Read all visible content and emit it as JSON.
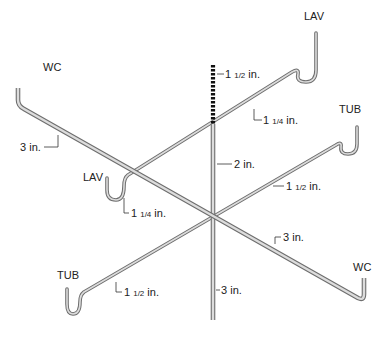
{
  "diagram": {
    "fixtures": {
      "lav_top": "LAV",
      "tub_right": "TUB",
      "wc_left": "WC",
      "lav_left": "LAV",
      "wc_right": "WC",
      "tub_left": "TUB"
    },
    "dimensions": {
      "vent_stack": "1 1/2 in.",
      "lav_top_branch": "1 1/4 in.",
      "stack_upper": "2 in.",
      "wc_left_branch": "3 in.",
      "lav_left_branch": "1 1/4 in.",
      "tub_right_branch": "1 1/2 in.",
      "wc_right_branch": "3 in.",
      "tub_left_branch": "1 1/2 in.",
      "stack_lower": "3 in."
    },
    "dim_parts": {
      "vent_stack": {
        "whole": "1 ",
        "frac": "1/2",
        "unit": " in."
      },
      "lav_top_branch": {
        "whole": "1 ",
        "frac": "1/4",
        "unit": " in."
      },
      "stack_upper": {
        "whole": "2",
        "frac": "",
        "unit": " in."
      },
      "wc_left_branch": {
        "whole": "3",
        "frac": "",
        "unit": " in."
      },
      "lav_left_branch": {
        "whole": "1 ",
        "frac": "1/4",
        "unit": " in."
      },
      "tub_right_branch": {
        "whole": "1 ",
        "frac": "1/2",
        "unit": " in."
      },
      "wc_right_branch": {
        "whole": "3",
        "frac": "",
        "unit": " in."
      },
      "tub_left_branch": {
        "whole": "1 ",
        "frac": "1/2",
        "unit": " in."
      },
      "stack_lower": {
        "whole": "3",
        "frac": "",
        "unit": " in."
      }
    },
    "colors": {
      "pipe_fill": "#d9d9d9",
      "pipe_edge": "#6e6e6e",
      "vent_dots": "#111111",
      "text": "#222222"
    }
  }
}
